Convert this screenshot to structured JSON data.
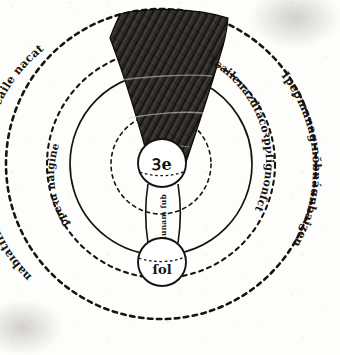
{
  "figure": {
    "kind": "medieval-astronomical-diagram"
  },
  "labels": {
    "center_body": "Ꝫe",
    "lower_body": "ſol",
    "column_text": "lunam ſub ſole",
    "ring_inner_left": "ꝑpeꝛu naſgine",
    "ring_middle_right": "Tcailenazdtacoꝛpꝩſignonſct",
    "ring_outer_left": "nabıatıſbıdıgıdȷmanacuīŏ ofcaile nacat",
    "ring_outer_right": "Ipeꝑmanagınŏbnáɑnbaiʒen"
  },
  "rings": [
    {
      "name": "sphere-outer",
      "radius": 155,
      "style": "dashed"
    },
    {
      "name": "sphere-second",
      "radius": 114,
      "style": "dashed"
    },
    {
      "name": "sphere-third",
      "radius": 91,
      "style": "solid"
    },
    {
      "name": "sphere-inner",
      "radius": 50,
      "style": "dashed"
    }
  ],
  "bodies": [
    {
      "name": "earth",
      "label": "Ꝫe",
      "cx": 162,
      "cy": 163,
      "r": 24
    },
    {
      "name": "sun",
      "label": "ſol",
      "cx": 162,
      "cy": 262,
      "r": 24
    }
  ],
  "shadow_cone": {
    "name": "umbra-cone",
    "apex_x": 162,
    "apex_y": 175,
    "fill": "#2a2722",
    "hatching": true
  },
  "colors": {
    "ink": "#161410",
    "paper": "#fdfdfb",
    "shadow": "#2a2722"
  },
  "column": {
    "name": "shadow-column",
    "top_y": 186,
    "bottom_y": 243,
    "left_x": 146,
    "right_x": 180
  }
}
